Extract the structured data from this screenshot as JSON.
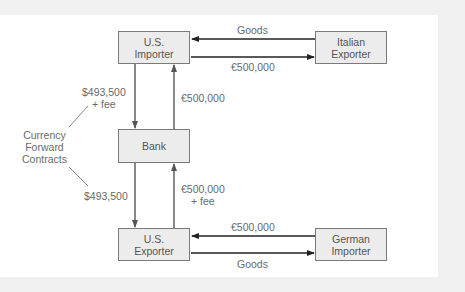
{
  "diagram": {
    "nodes": {
      "us_importer": {
        "line1": "U.S.",
        "line2": "Importer"
      },
      "italian_exporter": {
        "line1": "Italian",
        "line2": "Exporter"
      },
      "bank": {
        "line1": "Bank"
      },
      "us_exporter": {
        "line1": "U.S.",
        "line2": "Exporter"
      },
      "german_importer": {
        "line1": "German",
        "line2": "Importer"
      }
    },
    "edges": {
      "top_goods": "Goods",
      "top_euro": "€500,000",
      "importer_to_bank_1": "$493,500",
      "importer_to_bank_2": "+ fee",
      "bank_to_importer": "€500,000",
      "bank_to_exporter": "$493,500",
      "exporter_to_bank_1": "€500,000",
      "exporter_to_bank_2": "+ fee",
      "bottom_euro": "€500,000",
      "bottom_goods": "Goods"
    },
    "annotation": {
      "line1": "Currency",
      "line2": "Forward",
      "line3": "Contracts"
    },
    "colors": {
      "box_fill": "#ececec",
      "box_border": "#7a7a7a",
      "arrow_dark": "#222222",
      "arrow_gray": "#555555",
      "text": "#6a6a6a"
    }
  }
}
